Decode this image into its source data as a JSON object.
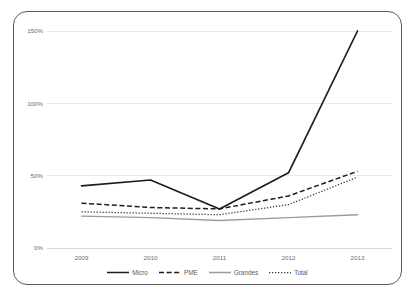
{
  "top_caption": "",
  "chart_data": {
    "type": "line",
    "title": "",
    "subtitle": "",
    "xlabel": "",
    "ylabel": "",
    "categories": [
      "2009",
      "2010",
      "2011",
      "2012",
      "2013"
    ],
    "x_tick_labels": [
      "2009",
      "2010",
      "2011",
      "2012",
      "2013"
    ],
    "y_tick_labels": [
      "0%",
      "50%",
      "100%",
      "150%"
    ],
    "y_tick_values": [
      0,
      50,
      100,
      150
    ],
    "ylim": [
      0,
      150
    ],
    "y_unit": "%",
    "grid": true,
    "legend_position": "bottom",
    "series": [
      {
        "name": "Micro",
        "style": "solid",
        "color": "#1d1d1d",
        "values": [
          43,
          47,
          27,
          52,
          150
        ]
      },
      {
        "name": "PME",
        "style": "dashed",
        "color": "#1d1d1d",
        "values": [
          31,
          28,
          27,
          36,
          53
        ]
      },
      {
        "name": "Grandes",
        "style": "solid-thin",
        "color": "#9b9b9b",
        "values": [
          22,
          21,
          19,
          21,
          23
        ]
      },
      {
        "name": "Total",
        "style": "dotted",
        "color": "#3b3b3b",
        "values": [
          25,
          24,
          23,
          30,
          49
        ]
      }
    ],
    "legend_entries": [
      {
        "label": "Micro",
        "style": "solid",
        "color": "#1d1d1d"
      },
      {
        "label": "PME",
        "style": "dashed",
        "color": "#1d1d1d"
      },
      {
        "label": "Grandes",
        "style": "solid-thin",
        "color": "#9b9b9b"
      },
      {
        "label": "Total",
        "style": "dotted",
        "color": "#3b3b3b"
      }
    ]
  },
  "colors": {
    "frame": "#5a5a5a",
    "grid": "#e9e9e9",
    "tick_text": "#6e6e6e",
    "background": "#ffffff"
  }
}
